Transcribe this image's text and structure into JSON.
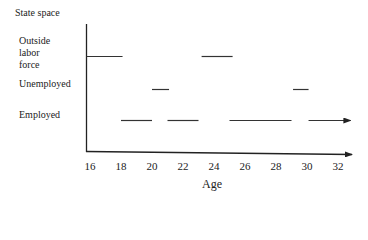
{
  "chart_data": {
    "type": "line",
    "title": "",
    "ylabel": "State space",
    "xlabel": "Age",
    "x_ticks": [
      "16",
      "18",
      "20",
      "22",
      "24",
      "26",
      "28",
      "30",
      "32"
    ],
    "xlim": [
      16,
      33
    ],
    "states": [
      "Outside labor force",
      "Unemployed",
      "Employed"
    ],
    "state_label_lines": {
      "outside": [
        "Outside",
        "labor",
        "force"
      ],
      "unemployed": "Unemployed",
      "employed": "Employed"
    },
    "series": [
      {
        "state": "Outside labor force",
        "segments": [
          [
            16,
            18.1
          ],
          [
            23.2,
            25.2
          ]
        ]
      },
      {
        "state": "Unemployed",
        "segments": [
          [
            20,
            21.1
          ],
          [
            29.1,
            30.1
          ]
        ]
      },
      {
        "state": "Employed",
        "segments": [
          [
            18,
            20
          ],
          [
            21,
            23
          ],
          [
            25,
            29
          ],
          [
            30.1,
            32.8
          ]
        ],
        "last_segment_arrow": true
      }
    ],
    "grid": false,
    "legend": "none"
  }
}
